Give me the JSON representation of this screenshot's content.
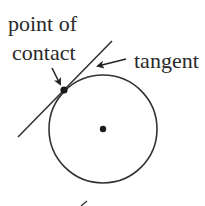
{
  "diagram": {
    "labels": {
      "point_of_contact_line1": "point of",
      "point_of_contact_line2": "contact",
      "tangent": "tangent"
    },
    "elements": {
      "circle": {
        "cx": 103,
        "cy": 129,
        "r": 54
      },
      "center_point": {
        "cx": 103,
        "cy": 129,
        "r": 3.2
      },
      "contact_point": {
        "cx": 64,
        "cy": 90,
        "r": 3.6
      },
      "tangent_line": {
        "x1": 18,
        "y1": 137,
        "x2": 112,
        "y2": 41
      }
    },
    "colors": {
      "stroke": "#333333",
      "text": "#2a2a2a",
      "background": "#ffffff"
    }
  }
}
